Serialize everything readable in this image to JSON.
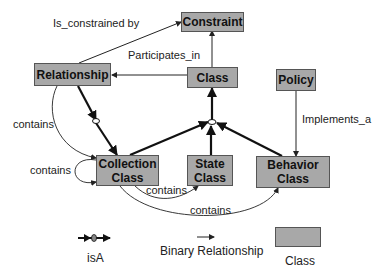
{
  "classes": {
    "constraint": "Constraint",
    "relationship": "Relationship",
    "class": "Class",
    "policy": "Policy",
    "collection_line1": "Collection",
    "collection_line2": "Class",
    "state_line1": "State",
    "state_line2": "Class",
    "behavior_line1": "Behavior",
    "behavior_line2": "Class"
  },
  "edges": {
    "is_constrained_by": "Is_constrained by",
    "participates_in": "Participates_in",
    "implements_a": "Implements_a",
    "contains_rel_collection": "contains",
    "contains_self": "contains",
    "contains_collection_state": "contains",
    "contains_collection_behavior": "contains"
  },
  "legend": {
    "isa": "isA",
    "binary": "Binary Relationship",
    "class": "Class"
  },
  "colors": {
    "class_fill": "#a8a8a8",
    "class_border": "#555555",
    "edge": "#222222"
  }
}
